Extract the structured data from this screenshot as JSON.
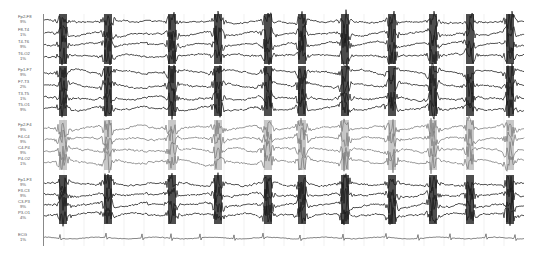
{
  "chart_data": {
    "type": "line",
    "title": "",
    "xlabel": "",
    "ylabel": "",
    "grid": "faint vertical time gridlines",
    "trace_colors": {
      "default": "#1a1a1a",
      "group3": "#7a7a7a",
      "ecg": "#555555"
    },
    "burst_x_px": [
      63,
      108,
      172,
      218,
      268,
      302,
      345,
      392,
      433,
      470,
      510
    ],
    "ecg_qrs_x_px": [
      60,
      106,
      142,
      171,
      200,
      234,
      263,
      300,
      343,
      386,
      418,
      450,
      486,
      515
    ],
    "channels": [
      {
        "label": "Fp2-F8",
        "sub": "9%",
        "y": 20,
        "group": 1
      },
      {
        "label": "F8-T4",
        "sub": "1%",
        "y": 33,
        "group": 1
      },
      {
        "label": "T4-T6",
        "sub": "9%",
        "y": 45,
        "group": 1
      },
      {
        "label": "T6-O2",
        "sub": "1%",
        "y": 57,
        "group": 1
      },
      {
        "label": "Fp1-F7",
        "sub": "9%",
        "y": 73,
        "group": 2
      },
      {
        "label": "F7-T3",
        "sub": "2%",
        "y": 85,
        "group": 2
      },
      {
        "label": "T3-T5",
        "sub": "1%",
        "y": 97,
        "group": 2
      },
      {
        "label": "T5-O1",
        "sub": "9%",
        "y": 108,
        "group": 2
      },
      {
        "label": "Fp2-F4",
        "sub": "9%",
        "y": 128,
        "group": 3
      },
      {
        "label": "F4-C4",
        "sub": "9%",
        "y": 140,
        "group": 3
      },
      {
        "label": "C4-P4",
        "sub": "9%",
        "y": 151,
        "group": 3
      },
      {
        "label": "P4-O2",
        "sub": "1%",
        "y": 162,
        "group": 3
      },
      {
        "label": "Fp1-F3",
        "sub": "9%",
        "y": 183,
        "group": 4
      },
      {
        "label": "F3-C3",
        "sub": "9%",
        "y": 194,
        "group": 4
      },
      {
        "label": "C3-P3",
        "sub": "9%",
        "y": 205,
        "group": 4
      },
      {
        "label": "P3-O1",
        "sub": "4%",
        "y": 216,
        "group": 4
      },
      {
        "label": "ECG",
        "sub": "1%",
        "y": 238,
        "group": 5
      }
    ]
  }
}
